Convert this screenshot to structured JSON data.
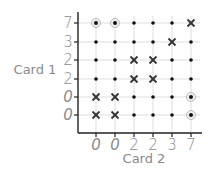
{
  "chart_data": {
    "type": "scatter",
    "title": "",
    "xlabel": "Card 2",
    "ylabel": "Card 1",
    "x_ticks": [
      "0",
      "0",
      "2",
      "2",
      "3",
      "7"
    ],
    "y_ticks_top_to_bottom": [
      "7",
      "3",
      "2",
      "2",
      "0",
      "0"
    ],
    "grid": true,
    "legend": "none",
    "marker_legend": {
      "dot": "no match",
      "cross": "sum is a match (x marks)",
      "circled-dot": "special pair"
    },
    "cells": [
      [
        "circle",
        "circle",
        "dot",
        "dot",
        "dot",
        "cross"
      ],
      [
        "dot",
        "dot",
        "dot",
        "dot",
        "cross",
        "dot"
      ],
      [
        "dot",
        "dot",
        "cross",
        "cross",
        "dot",
        "dot"
      ],
      [
        "dot",
        "dot",
        "cross",
        "cross",
        "dot",
        "dot"
      ],
      [
        "cross",
        "cross",
        "dot",
        "dot",
        "dot",
        "circle"
      ],
      [
        "cross",
        "cross",
        "dot",
        "dot",
        "dot",
        "circle"
      ]
    ]
  },
  "axes": {
    "x_title": "Card 2",
    "y_title": "Card 1"
  },
  "colors": {
    "axis": "#222222",
    "grid": "#dddddd",
    "dot": "#111111",
    "cross": "#333333",
    "circle_halo": "#bbbbbb",
    "label": "#8a8a8a"
  }
}
